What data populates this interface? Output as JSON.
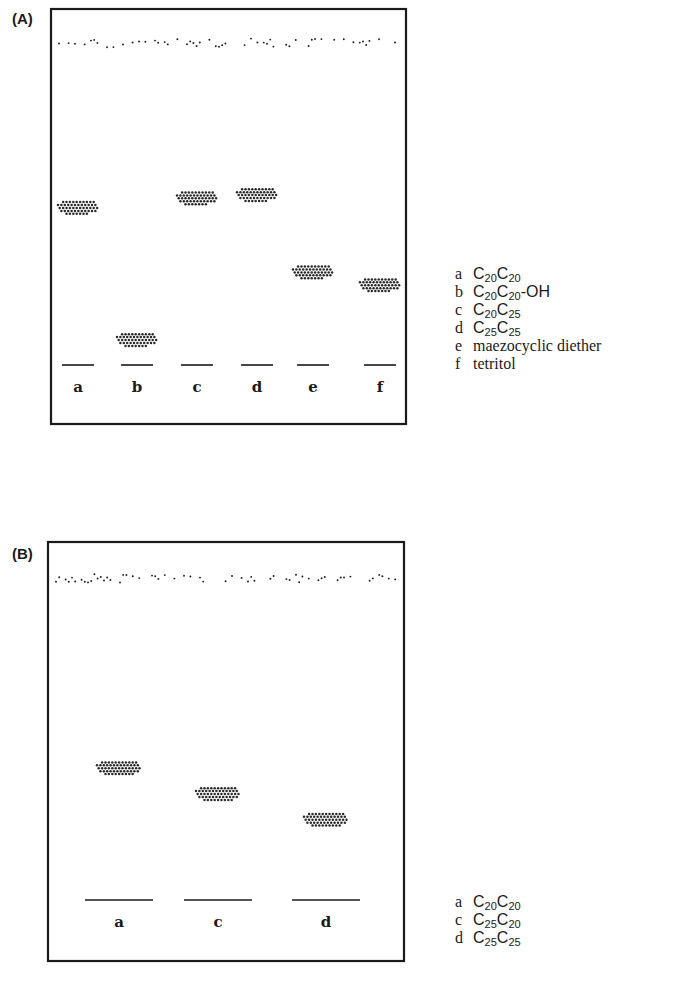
{
  "panels": [
    {
      "id": "A",
      "label": "(A)",
      "lanes": [
        {
          "key": "a",
          "rf": 0.49
        },
        {
          "key": "b",
          "rf": 0.08
        },
        {
          "key": "c",
          "rf": 0.52
        },
        {
          "key": "d",
          "rf": 0.53
        },
        {
          "key": "e",
          "rf": 0.29
        },
        {
          "key": "f",
          "rf": 0.25
        }
      ],
      "legend": [
        {
          "key": "a",
          "parts": [
            [
              "C",
              ""
            ],
            [
              "20",
              "sub"
            ],
            [
              "C",
              ""
            ],
            [
              "20",
              "sub"
            ]
          ]
        },
        {
          "key": "b",
          "parts": [
            [
              "C",
              ""
            ],
            [
              "20",
              "sub"
            ],
            [
              "C",
              ""
            ],
            [
              "20",
              "sub"
            ],
            [
              "-OH",
              ""
            ]
          ]
        },
        {
          "key": "c",
          "parts": [
            [
              "C",
              ""
            ],
            [
              "20",
              "sub"
            ],
            [
              "C",
              ""
            ],
            [
              "25",
              "sub"
            ]
          ]
        },
        {
          "key": "d",
          "parts": [
            [
              "C",
              ""
            ],
            [
              "25",
              "sub"
            ],
            [
              "C",
              ""
            ],
            [
              "25",
              "sub"
            ]
          ]
        },
        {
          "key": "e",
          "text": "maezocyclic diether"
        },
        {
          "key": "f",
          "text": "tetritol"
        }
      ]
    },
    {
      "id": "B",
      "label": "(B)",
      "lanes": [
        {
          "key": "a",
          "rf": 0.41
        },
        {
          "key": "c",
          "rf": 0.33
        },
        {
          "key": "d",
          "rf": 0.25
        }
      ],
      "legend": [
        {
          "key": "a",
          "parts": [
            [
              "C",
              ""
            ],
            [
              "20",
              "sub"
            ],
            [
              "C",
              ""
            ],
            [
              "20",
              "sub"
            ]
          ]
        },
        {
          "key": "c",
          "parts": [
            [
              "C",
              ""
            ],
            [
              "25",
              "sub"
            ],
            [
              "C",
              ""
            ],
            [
              "20",
              "sub"
            ]
          ]
        },
        {
          "key": "d",
          "parts": [
            [
              "C",
              ""
            ],
            [
              "25",
              "sub"
            ],
            [
              "C",
              ""
            ],
            [
              "25",
              "sub"
            ]
          ]
        }
      ]
    }
  ],
  "colors": {
    "ink": "#1a1a1a",
    "spot": "#2a2a2a",
    "background": "#ffffff"
  }
}
